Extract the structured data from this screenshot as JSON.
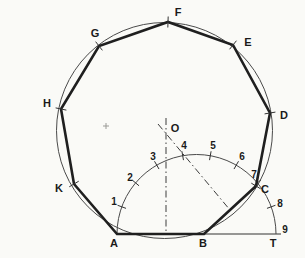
{
  "figure": {
    "background": "#fafaf7",
    "heavy_line_color": "#1f1f1f",
    "thin_line_color": "#4a4a4a",
    "label_color": "#1a1a1a",
    "circumscribed_circle": {
      "cx": 164.5,
      "cy": 130.5,
      "r": 108
    },
    "polygon": {
      "sides": 9,
      "vertices": [
        {
          "label": "A",
          "x": 117,
          "y": 234,
          "lx": 114,
          "ly": 243,
          "tick": false
        },
        {
          "label": "B",
          "x": 204,
          "y": 234,
          "lx": 203,
          "ly": 243,
          "tick": false
        },
        {
          "label": "C",
          "x": 256,
          "y": 186,
          "lx": 265,
          "ly": 189,
          "tick": true
        },
        {
          "label": "D",
          "x": 270,
          "y": 113,
          "lx": 284,
          "ly": 115,
          "tick": true
        },
        {
          "label": "E",
          "x": 233,
          "y": 45,
          "lx": 248,
          "ly": 42,
          "tick": true
        },
        {
          "label": "F",
          "x": 168,
          "y": 22,
          "lx": 178,
          "ly": 12,
          "tick": true
        },
        {
          "label": "G",
          "x": 99,
          "y": 46,
          "lx": 95,
          "ly": 33,
          "tick": true
        },
        {
          "label": "H",
          "x": 61,
          "y": 109,
          "lx": 47,
          "ly": 103,
          "tick": true
        },
        {
          "label": "K",
          "x": 74,
          "y": 184,
          "lx": 59,
          "ly": 188,
          "tick": true
        }
      ]
    },
    "center_point": {
      "label": "O",
      "x": 166,
      "y": 133.5,
      "lx": 175,
      "ly": 128
    },
    "semicircle": {
      "cx": 196.5,
      "cy": 234,
      "r": 79.5
    },
    "arc_divisions": [
      {
        "label": "1",
        "angle": 160,
        "lx": 114,
        "ly": 202
      },
      {
        "label": "2",
        "angle": 140,
        "lx": 130,
        "ly": 178
      },
      {
        "label": "3",
        "angle": 120,
        "lx": 153,
        "ly": 157
      },
      {
        "label": "4",
        "angle": 100,
        "lx": 184,
        "ly": 146
      },
      {
        "label": "5",
        "angle": 80,
        "lx": 213,
        "ly": 146
      },
      {
        "label": "6",
        "angle": 60,
        "lx": 242,
        "ly": 157
      },
      {
        "label": "7",
        "angle": 40,
        "lx": 254,
        "ly": 175
      },
      {
        "label": "8",
        "angle": 20,
        "lx": 280,
        "ly": 204
      },
      {
        "label": "9",
        "angle": 0,
        "lx": 285,
        "ly": 230
      }
    ],
    "tangent_point": {
      "label": "T",
      "x": 276,
      "y": 234,
      "lx": 273,
      "ly": 243
    },
    "baseline": {
      "x1": 117,
      "y1": 234,
      "x2": 281,
      "y2": 234
    },
    "dashed_lines": [
      {
        "name": "perpendicular-bisector-ab",
        "x1": 166,
        "y1": 118,
        "x2": 166,
        "y2": 234
      },
      {
        "name": "perpendicular-bisector-bc",
        "x1": 158,
        "y1": 124,
        "x2": 230,
        "y2": 210
      }
    ],
    "compass_prick_mark": {
      "x": 106,
      "y": 126
    }
  }
}
